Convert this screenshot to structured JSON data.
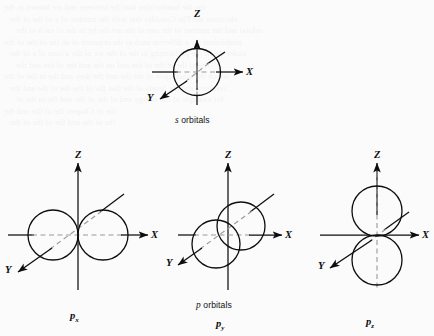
{
  "page": {
    "background_color": "#fbfbfb",
    "ink_color": "#0d0d0d"
  },
  "ghost_text": {
    "note": "faint bleed-through text from reverse of scanned page, illegible",
    "lines": [
      "the the handwritten that the between and are known as the",
      "electrons are The Consider that with the number of a of the of the",
      "orbital and the number of the one of the are the by in the of each of the",
      "established for a different such as the required of an the of the of the",
      "under the of the performing to the of the we of the a time of a of the",
      "the of the of the of the and on the and the of the and the",
      "which the other upon of the the and the they and the in the of the",
      "resulting and the bonds of the that the of the the of the and the",
      "for example of the energy and of the of the and the in the of",
      "the of Chapter the of the and the",
      "the of the and the of the of the"
    ]
  },
  "diagrams": [
    {
      "id": "s-orbital",
      "label": "s orbitals",
      "label_italic_part": "s",
      "label_plain_part": " orbitals",
      "axes": [
        "Z",
        "X",
        "Y"
      ],
      "shape": "single sphere centered at origin"
    },
    {
      "id": "px-orbital",
      "label": "p",
      "subscript": "x",
      "axes": [
        "Z",
        "X",
        "Y"
      ],
      "shape": "two lobes along X axis"
    },
    {
      "id": "py-orbital",
      "label": "p",
      "subscript": "y",
      "axes": [
        "Z",
        "X",
        "Y"
      ],
      "shape": "two lobes along Y axis drawn in perspective, overlapping"
    },
    {
      "id": "pz-orbital",
      "label": "p",
      "subscript": "z",
      "axes": [
        "Z",
        "X",
        "Y"
      ],
      "shape": "two lobes along Z axis"
    }
  ],
  "p_caption": {
    "italic_part": "p",
    "plain_part": " orbitals"
  },
  "axis_labels": {
    "z": "Z",
    "x": "X",
    "y": "Y"
  }
}
